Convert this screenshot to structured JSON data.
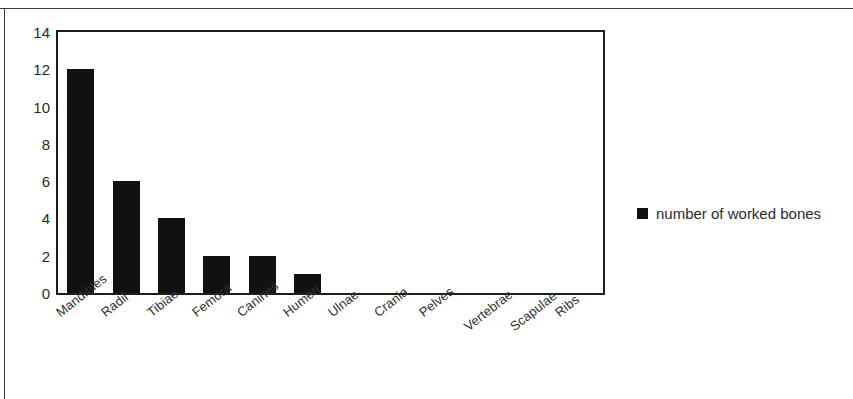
{
  "chart_data": {
    "type": "bar",
    "title": "",
    "subtitle": "",
    "xlabel": "",
    "ylabel": "",
    "categories": [
      "Mandibles",
      "Radii",
      "Tibiae",
      "Femora",
      "Canines",
      "Humeri",
      "Ulnae",
      "Crania",
      "Pelves",
      "Vertebrae",
      "Scapulae",
      "Ribs"
    ],
    "series": [
      {
        "name": "number of worked bones",
        "values": [
          12,
          6,
          4,
          2,
          2,
          1,
          0,
          0,
          0,
          0,
          0,
          0
        ],
        "color": "#111111"
      }
    ],
    "ylim": [
      0,
      14
    ],
    "yticks": [
      0,
      2,
      4,
      6,
      8,
      10,
      12,
      14
    ],
    "ytick_labels": [
      "0",
      "2",
      "4",
      "6",
      "8",
      "10",
      "12",
      "14"
    ],
    "grid": false,
    "legend": {
      "position": "right",
      "entries": [
        {
          "label": "number of worked bones",
          "color": "#111111"
        }
      ]
    },
    "xtick_rotation": -38,
    "frame_color": "#1d1d1d",
    "background": "#ffffff"
  }
}
